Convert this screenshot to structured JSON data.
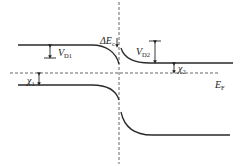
{
  "diagram": {
    "type": "heterojunction energy band diagram",
    "labels": {
      "delta_ec": {
        "main": "ΔE",
        "sub": "c"
      },
      "vd1": {
        "main": "V",
        "sub": "D1"
      },
      "vd2": {
        "main": "V",
        "sub": "D2"
      },
      "chi1": {
        "main": "χ",
        "sub": "1"
      },
      "chi2": {
        "main": "χ",
        "sub": "2"
      },
      "ef": {
        "main": "E",
        "sub": "F"
      }
    },
    "colors": {
      "line": "#2a2a2a",
      "dashed": "#555555",
      "background": "#ffffff"
    }
  }
}
